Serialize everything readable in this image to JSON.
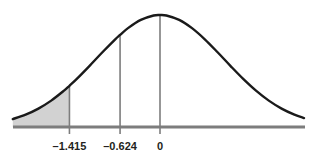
{
  "chart_data": {
    "type": "area",
    "title": "",
    "subtitle": "",
    "xlabel": "",
    "ylabel": "",
    "distribution": "standard normal",
    "mean": 0,
    "sd": 1,
    "grid": false,
    "legend": null,
    "xlim": [
      -2.3,
      2.25
    ],
    "ylim": [
      0,
      0.4
    ],
    "tick_values": [
      -1.415,
      -0.624,
      0
    ],
    "tick_labels": [
      "–1.415",
      "–0.624",
      "0"
    ],
    "curve_points_x": [
      -2.3,
      -2.1,
      -1.9,
      -1.7,
      -1.5,
      -1.415,
      -1.3,
      -1.1,
      -0.9,
      -0.7,
      -0.624,
      -0.5,
      -0.3,
      -0.1,
      0,
      0.1,
      0.3,
      0.5,
      0.7,
      0.9,
      1.1,
      1.3,
      1.5,
      1.7,
      1.9,
      2.1,
      2.25
    ],
    "curve_points_y": [
      0.0283,
      0.044,
      0.0656,
      0.094,
      0.1295,
      0.1468,
      0.1714,
      0.2179,
      0.2661,
      0.3123,
      0.328,
      0.3521,
      0.3814,
      0.397,
      0.3989,
      0.397,
      0.3814,
      0.3521,
      0.3123,
      0.2661,
      0.2179,
      0.1714,
      0.1295,
      0.094,
      0.0656,
      0.044,
      0.0317
    ],
    "shaded_region": {
      "from": -2.3,
      "to": -1.415,
      "label": "left tail",
      "fill": "#d2d2d2"
    },
    "vertical_markers": [
      {
        "x": -1.415,
        "label": "–1.415"
      },
      {
        "x": -0.624,
        "label": "–0.624"
      },
      {
        "x": 0,
        "label": "0"
      }
    ],
    "colors": {
      "background": "#ffffff",
      "curve": "#1a1a1a",
      "axis": "#7d7d7d",
      "marker_line": "#7d7d7d",
      "shade": "#d2d2d2",
      "tick_text": "#231f20"
    }
  },
  "axis": {
    "name": "horizontal-axis"
  }
}
